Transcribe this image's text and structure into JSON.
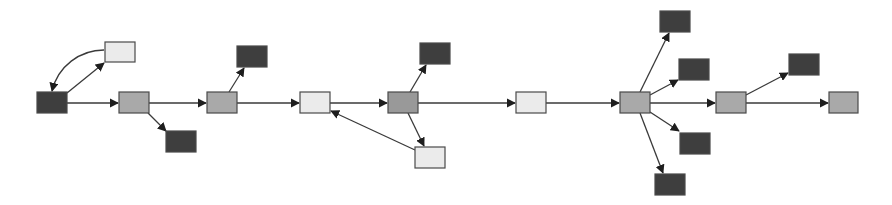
{
  "diagram": {
    "type": "directed-graph",
    "colors": {
      "dark": "#3e3e3e",
      "mid": "#a9a9a9",
      "mid_dark": "#999999",
      "light": "#ebebeb",
      "edge": "#3a3a3a",
      "border": "#4a4a4a"
    },
    "nodes": [
      {
        "id": "n1",
        "x": 37,
        "y": 92,
        "w": 30,
        "h": 21,
        "shade": "dark"
      },
      {
        "id": "n2",
        "x": 105,
        "y": 42,
        "w": 30,
        "h": 20,
        "shade": "light"
      },
      {
        "id": "n3",
        "x": 119,
        "y": 92,
        "w": 30,
        "h": 21,
        "shade": "mid"
      },
      {
        "id": "n4",
        "x": 166,
        "y": 131,
        "w": 30,
        "h": 21,
        "shade": "dark"
      },
      {
        "id": "n5",
        "x": 207,
        "y": 92,
        "w": 30,
        "h": 21,
        "shade": "mid"
      },
      {
        "id": "n6",
        "x": 237,
        "y": 46,
        "w": 30,
        "h": 21,
        "shade": "dark"
      },
      {
        "id": "n7",
        "x": 300,
        "y": 92,
        "w": 30,
        "h": 21,
        "shade": "light"
      },
      {
        "id": "n8",
        "x": 388,
        "y": 92,
        "w": 30,
        "h": 21,
        "shade": "mid_dark"
      },
      {
        "id": "n9",
        "x": 420,
        "y": 43,
        "w": 30,
        "h": 21,
        "shade": "dark"
      },
      {
        "id": "n10",
        "x": 415,
        "y": 147,
        "w": 30,
        "h": 21,
        "shade": "light"
      },
      {
        "id": "n11",
        "x": 516,
        "y": 92,
        "w": 30,
        "h": 21,
        "shade": "light"
      },
      {
        "id": "n12",
        "x": 620,
        "y": 92,
        "w": 30,
        "h": 21,
        "shade": "mid"
      },
      {
        "id": "n13",
        "x": 660,
        "y": 11,
        "w": 30,
        "h": 21,
        "shade": "dark"
      },
      {
        "id": "n14",
        "x": 679,
        "y": 59,
        "w": 30,
        "h": 21,
        "shade": "dark"
      },
      {
        "id": "n15",
        "x": 680,
        "y": 133,
        "w": 30,
        "h": 21,
        "shade": "dark"
      },
      {
        "id": "n16",
        "x": 655,
        "y": 174,
        "w": 30,
        "h": 21,
        "shade": "dark"
      },
      {
        "id": "n17",
        "x": 716,
        "y": 92,
        "w": 30,
        "h": 21,
        "shade": "mid"
      },
      {
        "id": "n18",
        "x": 789,
        "y": 54,
        "w": 30,
        "h": 21,
        "shade": "dark"
      },
      {
        "id": "n19",
        "x": 829,
        "y": 92,
        "w": 29,
        "h": 21,
        "shade": "mid"
      }
    ],
    "edges": [
      {
        "from": "n1",
        "to": "n2",
        "x1": 67,
        "y1": 93,
        "x2": 104,
        "y2": 63,
        "curve": false
      },
      {
        "from": "n2",
        "to": "n1",
        "path": "M104,50 C80,50 58,66 52,91",
        "curve": true
      },
      {
        "from": "n1",
        "to": "n3",
        "x1": 67,
        "y1": 103,
        "x2": 118,
        "y2": 103
      },
      {
        "from": "n3",
        "to": "n4",
        "x1": 148,
        "y1": 113,
        "x2": 166,
        "y2": 131
      },
      {
        "from": "n3",
        "to": "n5",
        "x1": 149,
        "y1": 103,
        "x2": 206,
        "y2": 103
      },
      {
        "from": "n5",
        "to": "n6",
        "x1": 229,
        "y1": 92,
        "x2": 244,
        "y2": 68
      },
      {
        "from": "n5",
        "to": "n7",
        "x1": 237,
        "y1": 103,
        "x2": 299,
        "y2": 103
      },
      {
        "from": "n7",
        "to": "n8",
        "x1": 330,
        "y1": 103,
        "x2": 387,
        "y2": 103
      },
      {
        "from": "n8",
        "to": "n9",
        "x1": 410,
        "y1": 92,
        "x2": 426,
        "y2": 65
      },
      {
        "from": "n8",
        "to": "n10",
        "x1": 408,
        "y1": 113,
        "x2": 424,
        "y2": 146
      },
      {
        "from": "n10",
        "to": "n7",
        "x1": 415,
        "y1": 150,
        "x2": 331,
        "y2": 111
      },
      {
        "from": "n8",
        "to": "n11",
        "x1": 418,
        "y1": 103,
        "x2": 515,
        "y2": 103
      },
      {
        "from": "n11",
        "to": "n12",
        "x1": 546,
        "y1": 103,
        "x2": 619,
        "y2": 103
      },
      {
        "from": "n12",
        "to": "n13",
        "x1": 640,
        "y1": 92,
        "x2": 669,
        "y2": 33
      },
      {
        "from": "n12",
        "to": "n14",
        "x1": 650,
        "y1": 95,
        "x2": 678,
        "y2": 80
      },
      {
        "from": "n12",
        "to": "n15",
        "x1": 650,
        "y1": 112,
        "x2": 679,
        "y2": 131
      },
      {
        "from": "n12",
        "to": "n16",
        "x1": 640,
        "y1": 113,
        "x2": 663,
        "y2": 173
      },
      {
        "from": "n12",
        "to": "n17",
        "x1": 650,
        "y1": 103,
        "x2": 715,
        "y2": 103
      },
      {
        "from": "n17",
        "to": "n18",
        "x1": 746,
        "y1": 95,
        "x2": 788,
        "y2": 73
      },
      {
        "from": "n17",
        "to": "n19",
        "x1": 746,
        "y1": 103,
        "x2": 828,
        "y2": 103
      }
    ]
  }
}
